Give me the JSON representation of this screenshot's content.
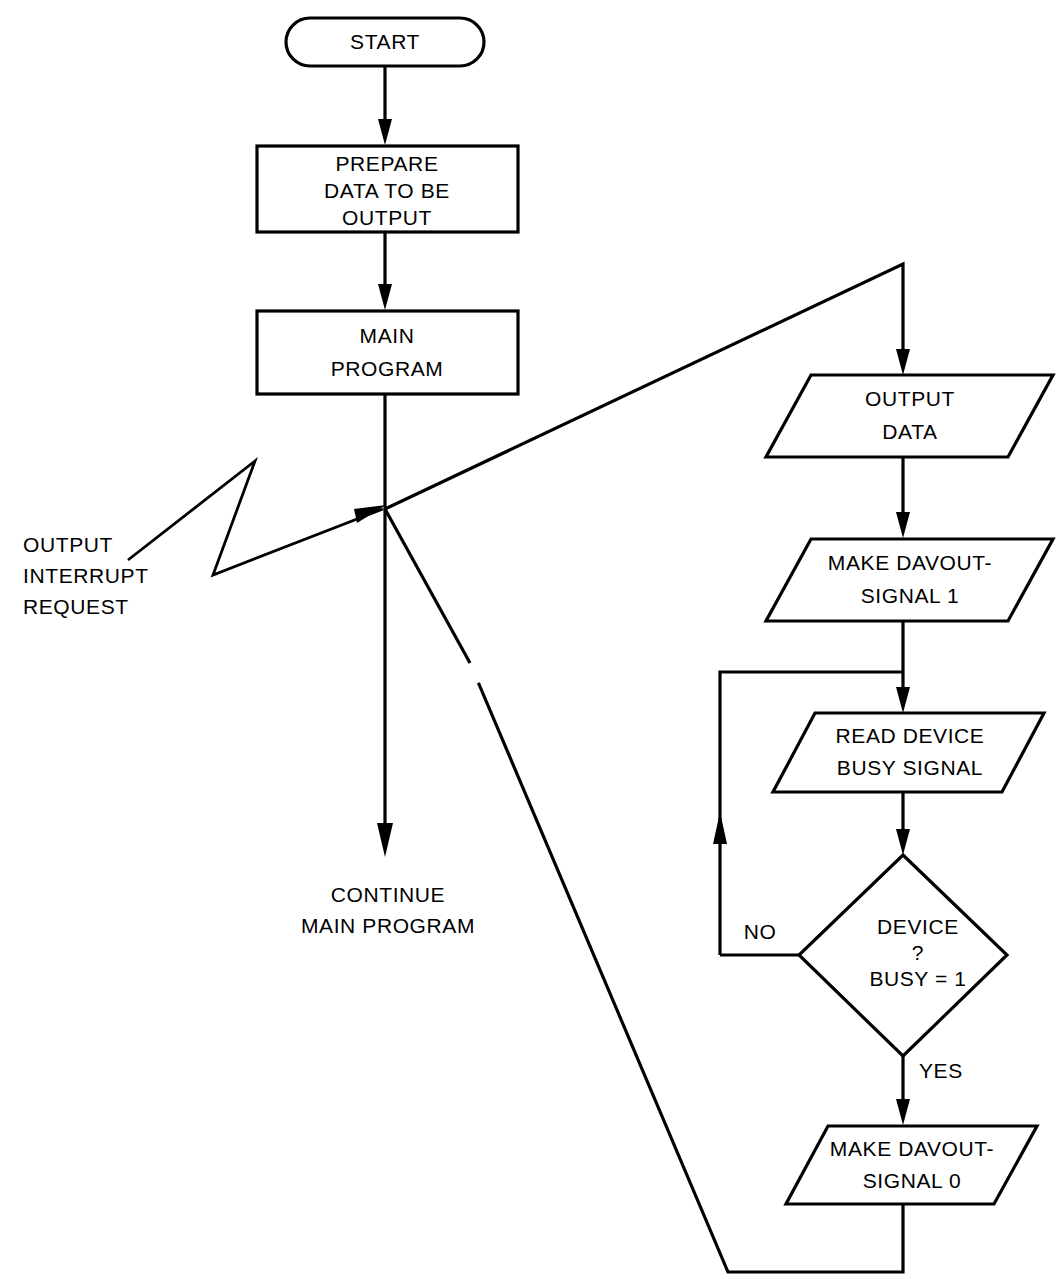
{
  "diagram": {
    "background_color": "#ffffff",
    "line_color": "#000000",
    "nodes": {
      "start": {
        "shape": "terminator",
        "label": "START"
      },
      "prepare": {
        "shape": "process",
        "line1": "PREPARE",
        "line2": "DATA TO BE",
        "line3": "OUTPUT"
      },
      "main_program": {
        "shape": "process",
        "line1": "MAIN",
        "line2": "PROGRAM"
      },
      "output_data": {
        "shape": "io-parallelogram",
        "line1": "OUTPUT",
        "line2": "DATA"
      },
      "make_davout_1": {
        "shape": "io-parallelogram",
        "line1": "MAKE  DAVOUT-",
        "line2": "SIGNAL 1"
      },
      "read_device_busy": {
        "shape": "io-parallelogram",
        "line1": "READ DEVICE",
        "line2": "BUSY SIGNAL"
      },
      "device_busy_decision": {
        "shape": "decision",
        "line1": "DEVICE",
        "line2": "?",
        "line3": "BUSY = 1"
      },
      "make_davout_0": {
        "shape": "io-parallelogram",
        "line1": "MAKE DAVOUT-",
        "line2": "SIGNAL 0"
      }
    },
    "annotations": {
      "interrupt_request": {
        "line1": "OUTPUT",
        "line2": "INTERRUPT",
        "line3": "REQUEST"
      },
      "continue_main": {
        "line1": "CONTINUE",
        "line2": "MAIN PROGRAM"
      }
    },
    "edge_labels": {
      "no": "NO",
      "yes": "YES"
    }
  }
}
